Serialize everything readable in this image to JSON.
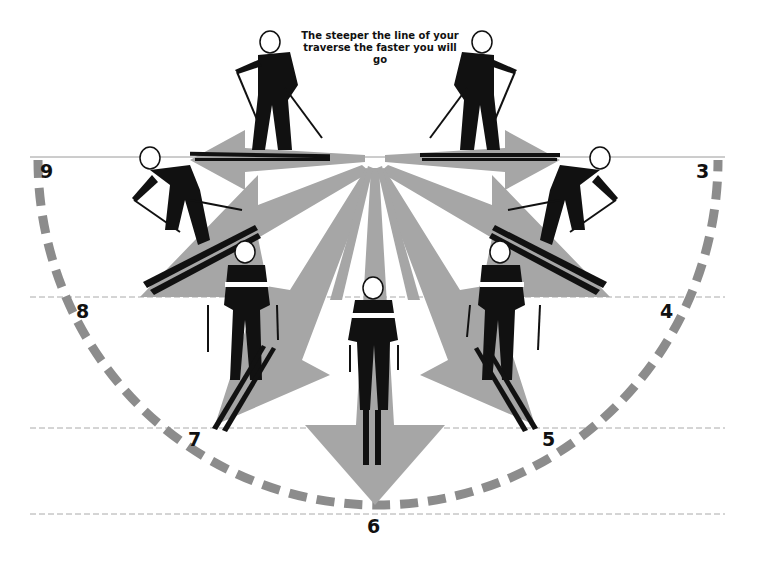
{
  "caption": {
    "line1": "The steeper the line of your",
    "line2": "traverse the faster you will go"
  },
  "positions": [
    {
      "label": "3",
      "x": 696,
      "y": 160
    },
    {
      "label": "4",
      "x": 660,
      "y": 300
    },
    {
      "label": "5",
      "x": 542,
      "y": 428
    },
    {
      "label": "6",
      "x": 367,
      "y": 515
    },
    {
      "label": "7",
      "x": 188,
      "y": 428
    },
    {
      "label": "8",
      "x": 76,
      "y": 300
    },
    {
      "label": "9",
      "x": 40,
      "y": 160
    }
  ],
  "colors": {
    "arrow": "#a6a6a6",
    "arc": "#8c8c8c",
    "line": "#9a9a9a",
    "figure": "#111111",
    "background": "#ffffff"
  }
}
